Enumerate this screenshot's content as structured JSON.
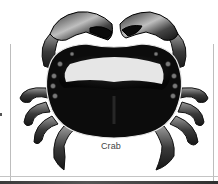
{
  "figure": {
    "caption": "Crab",
    "colors": {
      "shell_dark": "#0d0d0d",
      "shell_highlight": "#f2f2f2",
      "frame_line": "#bdbdbd",
      "caption_text": "#444444"
    }
  }
}
